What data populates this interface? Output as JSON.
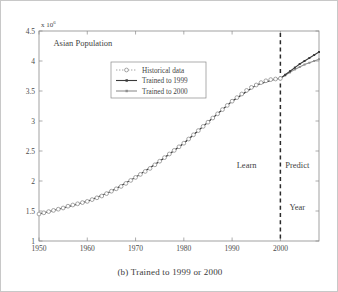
{
  "figure": {
    "caption": "(b) Trained to 1999 or 2000",
    "background_color": "#ffffff",
    "border_color": "#c8c8c8"
  },
  "chart_data": {
    "type": "line",
    "title": "Asian Population",
    "xlabel": "Year",
    "ylabel": "",
    "y_exponent_base": "x 10",
    "y_exponent_power": "6",
    "xlim": [
      1950,
      2008
    ],
    "ylim": [
      1,
      4.5
    ],
    "grid": false,
    "legend_position": "upper-left-inset",
    "xticks": [
      1950,
      1960,
      1970,
      1980,
      1990,
      2000
    ],
    "xticklabels": [
      "1950",
      "1960",
      "1970",
      "1980",
      "1990",
      "2000"
    ],
    "yticks": [
      1,
      1.5,
      2,
      2.5,
      3,
      3.5,
      4,
      4.5
    ],
    "yticklabels": [
      "1",
      "1.5",
      "2",
      "2.5",
      "3",
      "3.5",
      "4",
      "4.5"
    ],
    "annotations": [
      {
        "text": "Asian Population",
        "x": 1953,
        "y": 4.25
      },
      {
        "text": "Learn",
        "x": 1993,
        "y": 2.22
      },
      {
        "text": "Predict",
        "x": 2003.5,
        "y": 2.22
      },
      {
        "text": "Year",
        "x": 2003.5,
        "y": 1.52
      }
    ],
    "reference_line": {
      "x": 2000,
      "style": "dashed",
      "color": "#2b2b2b",
      "label": "train/predict split"
    },
    "series": [
      {
        "name": "Historical data",
        "style": "dotted-with-open-circle-markers",
        "color": "#9a9a9a",
        "x": [
          1950,
          1951,
          1952,
          1953,
          1954,
          1955,
          1956,
          1957,
          1958,
          1959,
          1960,
          1961,
          1962,
          1963,
          1964,
          1965,
          1966,
          1967,
          1968,
          1969,
          1970,
          1971,
          1972,
          1973,
          1974,
          1975,
          1976,
          1977,
          1978,
          1979,
          1980,
          1981,
          1982,
          1983,
          1984,
          1985,
          1986,
          1987,
          1988,
          1989,
          1990,
          1991,
          1992,
          1993,
          1994,
          1995,
          1996,
          1997,
          1998,
          1999,
          2000
        ],
        "values": [
          1.45,
          1.47,
          1.49,
          1.51,
          1.53,
          1.55,
          1.58,
          1.6,
          1.62,
          1.64,
          1.66,
          1.69,
          1.72,
          1.75,
          1.79,
          1.83,
          1.87,
          1.91,
          1.96,
          2.01,
          2.06,
          2.11,
          2.16,
          2.21,
          2.27,
          2.33,
          2.39,
          2.45,
          2.51,
          2.57,
          2.63,
          2.7,
          2.77,
          2.84,
          2.91,
          2.98,
          3.05,
          3.12,
          3.19,
          3.26,
          3.33,
          3.39,
          3.45,
          3.51,
          3.56,
          3.6,
          3.64,
          3.67,
          3.69,
          3.7,
          3.71
        ]
      },
      {
        "name": "Trained to 1999",
        "style": "solid-with-small-markers",
        "color": "#3a3a3a",
        "x": [
          1950,
          1955,
          1960,
          1965,
          1970,
          1975,
          1980,
          1985,
          1990,
          1995,
          1999,
          2000,
          2001,
          2002,
          2003,
          2004,
          2005,
          2006,
          2007,
          2008
        ],
        "values": [
          1.45,
          1.55,
          1.66,
          1.83,
          2.06,
          2.33,
          2.63,
          2.98,
          3.33,
          3.6,
          3.7,
          3.71,
          3.77,
          3.83,
          3.89,
          3.95,
          4.0,
          4.05,
          4.1,
          4.15
        ]
      },
      {
        "name": "Trained to 2000",
        "style": "solid-with-small-markers",
        "color": "#8f8f8f",
        "x": [
          1950,
          1955,
          1960,
          1965,
          1970,
          1975,
          1980,
          1985,
          1990,
          1995,
          1999,
          2000,
          2001,
          2002,
          2003,
          2004,
          2005,
          2006,
          2007,
          2008
        ],
        "values": [
          1.45,
          1.55,
          1.66,
          1.83,
          2.06,
          2.33,
          2.63,
          2.98,
          3.33,
          3.6,
          3.7,
          3.71,
          3.76,
          3.81,
          3.86,
          3.9,
          3.94,
          3.97,
          4.0,
          4.03
        ]
      }
    ]
  }
}
